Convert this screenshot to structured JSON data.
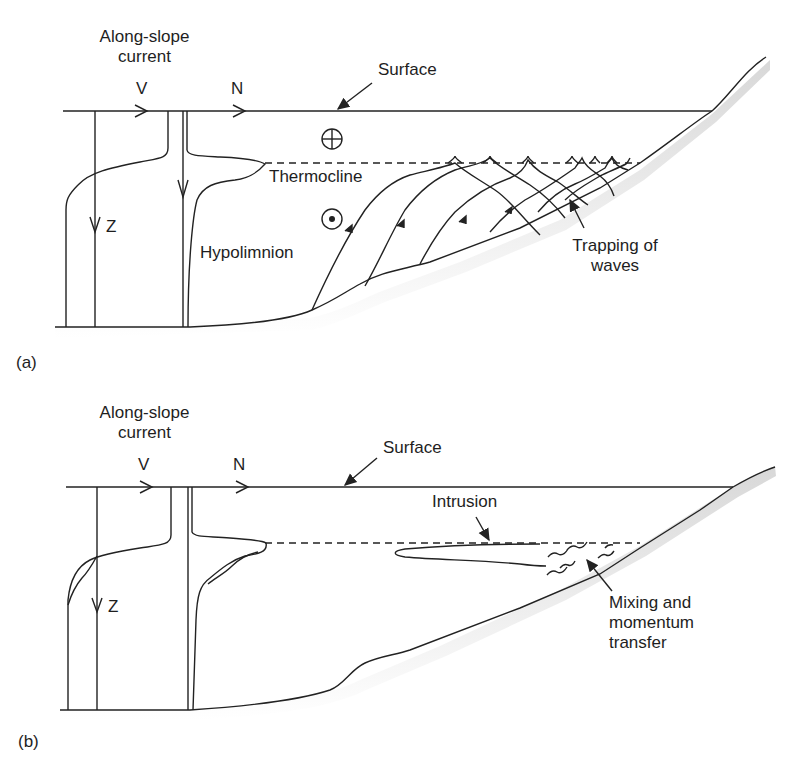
{
  "panel_a": {
    "label": "(a)",
    "along_slope_line1": "Along-slope",
    "along_slope_line2": "current",
    "v_label": "V",
    "n_label": "N",
    "surface_label": "Surface",
    "thermocline_label": "Thermocline",
    "hypolimnion_label": "Hypolimnion",
    "z_label": "Z",
    "trapping_line1": "Trapping of",
    "trapping_line2": "waves",
    "into_page_symbol": "⊕",
    "out_of_page_symbol": "⊙"
  },
  "panel_b": {
    "label": "(b)",
    "along_slope_line1": "Along-slope",
    "along_slope_line2": "current",
    "v_label": "V",
    "n_label": "N",
    "surface_label": "Surface",
    "intrusion_label": "Intrusion",
    "z_label": "Z",
    "mixing_line1": "Mixing and",
    "mixing_line2": "momentum",
    "mixing_line3": "transfer"
  }
}
